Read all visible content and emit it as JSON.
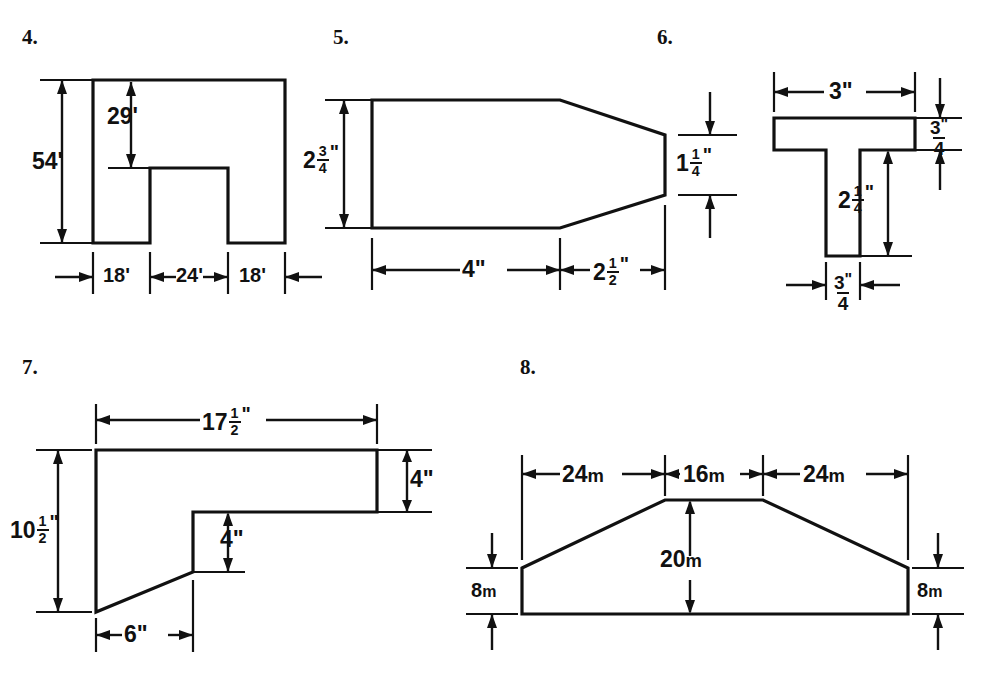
{
  "page": {
    "background": "#ffffff",
    "ink": "#111111"
  },
  "problems": [
    {
      "number": "4.",
      "shape": "notched-rectangle",
      "labels": {
        "height_total": "54'",
        "notch_depth": "29'",
        "width_left": "18'",
        "width_notch": "24'",
        "width_right": "18'"
      }
    },
    {
      "number": "5.",
      "shape": "tapered-hexagon",
      "labels": {
        "left_height_whole": "2",
        "left_height_num": "3",
        "left_height_den": "4",
        "left_height_unit": "\"",
        "right_height_whole": "1",
        "right_height_num": "1",
        "right_height_den": "4",
        "right_height_unit": "\"",
        "body_length": "4\"",
        "taper_whole": "2",
        "taper_num": "1",
        "taper_den": "2",
        "taper_unit": "\""
      }
    },
    {
      "number": "6.",
      "shape": "t-beam",
      "labels": {
        "top_width": "3\"",
        "flange_num": "3",
        "flange_den": "4",
        "flange_unit": "\"",
        "stem_height_whole": "2",
        "stem_height_num": "1",
        "stem_height_den": "4",
        "stem_height_unit": "\"",
        "stem_width_num": "3",
        "stem_width_den": "4",
        "stem_width_unit": "\""
      }
    },
    {
      "number": "7.",
      "shape": "angled-step",
      "labels": {
        "top_width_whole": "17",
        "top_width_num": "1",
        "top_width_den": "2",
        "top_width_unit": "\"",
        "left_height_whole": "10",
        "left_height_num": "1",
        "left_height_den": "2",
        "left_height_unit": "\"",
        "right_bar_height": "4\"",
        "step_height": "4\"",
        "bottom_width": "6\""
      }
    },
    {
      "number": "8.",
      "shape": "trapezoid-embankment",
      "labels": {
        "left_run": "24",
        "left_run_unit": "m",
        "top_width": "16",
        "top_width_unit": "m",
        "right_run": "24",
        "right_run_unit": "m",
        "total_height": "20",
        "total_height_unit": "m",
        "left_side": "8",
        "left_side_unit": "m",
        "right_side": "8",
        "right_side_unit": "m"
      }
    }
  ]
}
